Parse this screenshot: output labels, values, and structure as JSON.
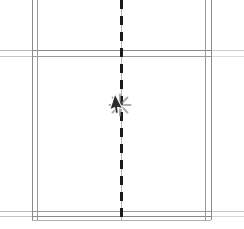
{
  "app": {
    "title": "CAD Floor Plan Viewport",
    "background_color": "#ffffff"
  },
  "viewport": {
    "width": 244,
    "height": 229,
    "description": "Architectural plan detail showing double-line wall runs and a dashed vertical centerline"
  },
  "colors": {
    "wall_line": "#8a8a8a",
    "wall_line_light": "#b4b4b4",
    "wall_line_fade": "#d8d8d8",
    "centerline": "#1a1a1a",
    "centerline_thin": "#9a9a9a",
    "cursor_fill": "#2b2b2b",
    "cursor_stroke": "#ffffff",
    "click_burst": "#8d8d8d",
    "canvas": "#ffffff"
  },
  "geometry": {
    "walls": {
      "vertical": [
        {
          "name": "left-wall-outer",
          "x": 32.0,
          "y1": 0,
          "y2": 220,
          "weight": 1.0,
          "color": "#8a8a8a"
        },
        {
          "name": "left-wall-inner",
          "x": 37.5,
          "y1": 0,
          "y2": 220,
          "weight": 1.0,
          "color": "#9a9a9a"
        },
        {
          "name": "right-wall-inner",
          "x": 205.5,
          "y1": 0,
          "y2": 220,
          "weight": 1.0,
          "color": "#9a9a9a"
        },
        {
          "name": "right-wall-outer",
          "x": 211.0,
          "y1": 0,
          "y2": 220,
          "weight": 1.0,
          "color": "#8a8a8a"
        }
      ],
      "horizontal": [
        {
          "name": "upper-wall-outer",
          "y": 50.5,
          "x1": 0,
          "x2": 244,
          "weight": 1.0,
          "color": "#8a8a8a"
        },
        {
          "name": "upper-wall-inner",
          "y": 56.0,
          "x1": 0,
          "x2": 244,
          "weight": 1.0,
          "color": "#9a9a9a"
        },
        {
          "name": "lower-wall-outer",
          "y": 211.0,
          "x1": 0,
          "x2": 244,
          "weight": 1.0,
          "color": "#9a9a9a"
        },
        {
          "name": "lower-wall-inner",
          "y": 216.5,
          "x1": 0,
          "x2": 244,
          "weight": 1.0,
          "color": "#8a8a8a"
        }
      ],
      "room_floor": {
        "name": "room-base-line",
        "y": 220.5,
        "x1": 32,
        "x2": 211,
        "color": "#b0b0b0"
      }
    },
    "centerline": {
      "name": "vertical-axis-centerline",
      "x": 121.5,
      "y1": 0,
      "y2": 220,
      "style": "dashed",
      "dash_length": 9,
      "gap_length": 7,
      "weight": 2.4,
      "color": "#1a1a1a",
      "hairline": {
        "weight": 0.7,
        "color": "#9a9a9a"
      }
    }
  },
  "cursor": {
    "name": "mouse-pointer",
    "x": 121,
    "y": 104,
    "type": "arrow",
    "rotation_deg": 18,
    "click_effect": {
      "name": "click-starburst",
      "visible": true,
      "center_x": 120,
      "center_y": 105,
      "ray_count": 8,
      "radius": 10,
      "color": "#8d8d8d"
    }
  },
  "labels": {
    "plan_name": "",
    "scale": "",
    "annotation": ""
  }
}
